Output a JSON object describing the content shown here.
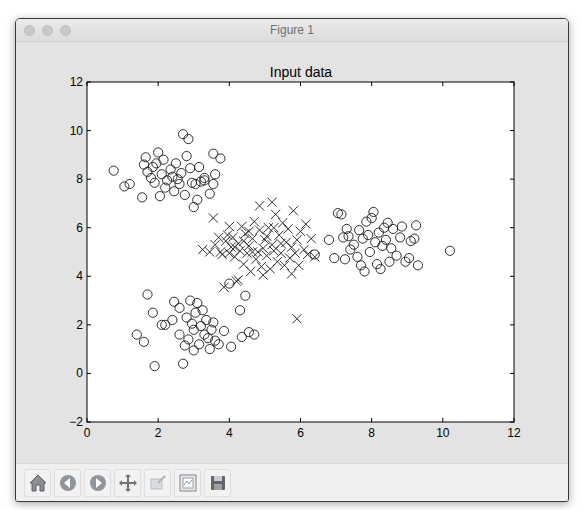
{
  "window": {
    "title": "Figure 1"
  },
  "toolbar": {
    "buttons": [
      {
        "name": "home",
        "icon": "home-icon",
        "tooltip": "Reset original view"
      },
      {
        "name": "back",
        "icon": "arrow-left-icon",
        "tooltip": "Back to previous view"
      },
      {
        "name": "forward",
        "icon": "arrow-right-icon",
        "tooltip": "Forward to next view"
      },
      {
        "name": "pan",
        "icon": "move-arrows-icon",
        "tooltip": "Pan axes"
      },
      {
        "name": "zoom",
        "icon": "zoom-rect-icon",
        "tooltip": "Zoom to rectangle"
      },
      {
        "name": "subplots",
        "icon": "subplots-config-icon",
        "tooltip": "Configure subplots"
      },
      {
        "name": "save",
        "icon": "floppy-disk-icon",
        "tooltip": "Save the figure"
      }
    ]
  },
  "colors": {
    "figure_bg": "#e3e3e3",
    "axes_bg": "#ffffff",
    "marker_edge": "#1a1a1a"
  },
  "chart_data": {
    "type": "scatter",
    "title": "Input data",
    "xlabel": "",
    "ylabel": "",
    "xlim": [
      0,
      12
    ],
    "ylim": [
      -2,
      12
    ],
    "xticks": [
      0,
      2,
      4,
      6,
      8,
      10,
      12
    ],
    "yticks": [
      -2,
      0,
      2,
      4,
      6,
      8,
      10,
      12
    ],
    "grid": false,
    "legend": null,
    "series": [
      {
        "name": "class-circle-upper-left",
        "marker": "o",
        "facecolor": "none",
        "points": [
          [
            0.75,
            8.35
          ],
          [
            1.05,
            7.7
          ],
          [
            1.2,
            7.8
          ],
          [
            1.55,
            7.25
          ],
          [
            1.6,
            8.6
          ],
          [
            1.65,
            8.9
          ],
          [
            1.7,
            8.3
          ],
          [
            1.8,
            8.05
          ],
          [
            1.85,
            8.5
          ],
          [
            1.9,
            7.85
          ],
          [
            1.95,
            8.65
          ],
          [
            2.0,
            9.1
          ],
          [
            2.05,
            7.3
          ],
          [
            2.1,
            8.2
          ],
          [
            2.15,
            8.8
          ],
          [
            2.2,
            7.65
          ],
          [
            2.25,
            7.95
          ],
          [
            2.35,
            8.4
          ],
          [
            2.4,
            8.1
          ],
          [
            2.45,
            7.5
          ],
          [
            2.5,
            8.65
          ],
          [
            2.55,
            8.0
          ],
          [
            2.6,
            7.8
          ],
          [
            2.65,
            8.25
          ],
          [
            2.7,
            9.85
          ],
          [
            2.75,
            7.35
          ],
          [
            2.8,
            8.95
          ],
          [
            2.85,
            9.65
          ],
          [
            2.9,
            8.45
          ],
          [
            2.95,
            7.85
          ],
          [
            3.0,
            6.85
          ],
          [
            3.05,
            7.8
          ],
          [
            3.1,
            7.15
          ],
          [
            3.15,
            8.5
          ],
          [
            3.2,
            7.9
          ],
          [
            3.3,
            7.95
          ],
          [
            3.45,
            7.4
          ],
          [
            3.55,
            7.8
          ],
          [
            3.6,
            8.2
          ],
          [
            3.55,
            9.05
          ],
          [
            3.75,
            8.85
          ],
          [
            3.3,
            8.05
          ]
        ]
      },
      {
        "name": "class-circle-lower-left",
        "marker": "o",
        "facecolor": "none",
        "points": [
          [
            1.4,
            1.6
          ],
          [
            1.6,
            1.3
          ],
          [
            1.7,
            3.25
          ],
          [
            1.9,
            0.3
          ],
          [
            1.85,
            2.5
          ],
          [
            2.1,
            2.0
          ],
          [
            2.2,
            2.0
          ],
          [
            2.4,
            2.2
          ],
          [
            2.45,
            2.95
          ],
          [
            2.6,
            2.7
          ],
          [
            2.6,
            1.6
          ],
          [
            2.7,
            0.4
          ],
          [
            2.75,
            1.15
          ],
          [
            2.8,
            2.3
          ],
          [
            2.85,
            1.4
          ],
          [
            2.9,
            3.0
          ],
          [
            2.95,
            2.05
          ],
          [
            3.0,
            0.95
          ],
          [
            3.0,
            1.8
          ],
          [
            3.05,
            2.5
          ],
          [
            3.1,
            2.9
          ],
          [
            3.15,
            1.2
          ],
          [
            3.2,
            1.95
          ],
          [
            3.25,
            2.6
          ],
          [
            3.3,
            1.6
          ],
          [
            3.35,
            2.2
          ],
          [
            3.4,
            1.45
          ],
          [
            3.45,
            1.0
          ],
          [
            3.5,
            1.8
          ],
          [
            3.55,
            2.1
          ],
          [
            3.6,
            1.35
          ],
          [
            3.7,
            1.2
          ],
          [
            3.85,
            1.75
          ],
          [
            4.05,
            1.1
          ],
          [
            4.3,
            2.6
          ],
          [
            4.35,
            1.5
          ],
          [
            4.45,
            3.2
          ],
          [
            4.55,
            1.7
          ],
          [
            4.7,
            1.6
          ],
          [
            4.0,
            3.7
          ]
        ]
      },
      {
        "name": "class-circle-right",
        "marker": "o",
        "facecolor": "none",
        "points": [
          [
            6.4,
            4.9
          ],
          [
            6.8,
            5.5
          ],
          [
            6.95,
            4.75
          ],
          [
            7.05,
            6.6
          ],
          [
            7.15,
            6.55
          ],
          [
            7.2,
            5.6
          ],
          [
            7.25,
            4.7
          ],
          [
            7.3,
            5.95
          ],
          [
            7.4,
            5.1
          ],
          [
            7.5,
            5.3
          ],
          [
            7.6,
            4.8
          ],
          [
            7.65,
            5.9
          ],
          [
            7.7,
            4.45
          ],
          [
            7.75,
            5.55
          ],
          [
            7.8,
            4.2
          ],
          [
            7.85,
            6.25
          ],
          [
            7.9,
            5.7
          ],
          [
            7.95,
            5.0
          ],
          [
            8.0,
            6.4
          ],
          [
            8.05,
            6.65
          ],
          [
            8.1,
            5.4
          ],
          [
            8.15,
            4.5
          ],
          [
            8.2,
            5.8
          ],
          [
            8.25,
            4.3
          ],
          [
            8.3,
            5.25
          ],
          [
            8.35,
            6.0
          ],
          [
            8.4,
            5.5
          ],
          [
            8.45,
            6.2
          ],
          [
            8.5,
            4.6
          ],
          [
            8.55,
            5.15
          ],
          [
            8.6,
            5.95
          ],
          [
            8.7,
            4.85
          ],
          [
            8.8,
            5.6
          ],
          [
            8.85,
            6.05
          ],
          [
            8.95,
            4.6
          ],
          [
            9.05,
            4.75
          ],
          [
            9.1,
            5.45
          ],
          [
            9.2,
            5.55
          ],
          [
            9.25,
            6.1
          ],
          [
            9.3,
            4.45
          ],
          [
            10.2,
            5.05
          ],
          [
            7.35,
            5.65
          ]
        ]
      },
      {
        "name": "class-cross-center",
        "marker": "x",
        "points": [
          [
            3.25,
            5.1
          ],
          [
            3.45,
            5.0
          ],
          [
            3.55,
            6.4
          ],
          [
            3.6,
            5.3
          ],
          [
            3.75,
            5.0
          ],
          [
            3.8,
            4.9
          ],
          [
            3.85,
            3.55
          ],
          [
            3.9,
            5.45
          ],
          [
            3.95,
            5.7
          ],
          [
            4.0,
            4.95
          ],
          [
            4.05,
            5.2
          ],
          [
            4.1,
            5.6
          ],
          [
            4.15,
            4.8
          ],
          [
            4.2,
            3.8
          ],
          [
            4.25,
            5.35
          ],
          [
            4.3,
            5.05
          ],
          [
            4.35,
            6.05
          ],
          [
            4.4,
            4.5
          ],
          [
            4.45,
            5.75
          ],
          [
            4.5,
            4.95
          ],
          [
            4.55,
            5.25
          ],
          [
            4.6,
            4.2
          ],
          [
            4.65,
            5.55
          ],
          [
            4.7,
            6.25
          ],
          [
            4.75,
            4.7
          ],
          [
            4.8,
            5.0
          ],
          [
            4.85,
            5.9
          ],
          [
            4.9,
            4.4
          ],
          [
            4.95,
            5.15
          ],
          [
            5.0,
            5.5
          ],
          [
            5.05,
            4.85
          ],
          [
            5.1,
            6.0
          ],
          [
            5.15,
            4.3
          ],
          [
            5.2,
            5.3
          ],
          [
            5.25,
            5.05
          ],
          [
            5.3,
            6.55
          ],
          [
            5.35,
            4.6
          ],
          [
            5.4,
            5.7
          ],
          [
            5.45,
            4.95
          ],
          [
            5.5,
            6.2
          ],
          [
            5.55,
            4.45
          ],
          [
            5.6,
            5.4
          ],
          [
            5.65,
            5.95
          ],
          [
            5.7,
            4.75
          ],
          [
            5.75,
            5.2
          ],
          [
            5.8,
            6.7
          ],
          [
            5.85,
            4.95
          ],
          [
            5.9,
            5.5
          ],
          [
            5.95,
            4.45
          ],
          [
            6.0,
            5.85
          ],
          [
            6.1,
            5.1
          ],
          [
            6.2,
            4.9
          ],
          [
            6.3,
            5.55
          ],
          [
            6.4,
            4.8
          ],
          [
            5.9,
            2.25
          ],
          [
            4.25,
            3.85
          ],
          [
            4.85,
            6.9
          ],
          [
            5.2,
            7.05
          ],
          [
            4.55,
            5.85
          ],
          [
            5.05,
            5.65
          ],
          [
            4.65,
            5.0
          ],
          [
            5.45,
            5.35
          ],
          [
            4.0,
            6.05
          ],
          [
            3.7,
            5.6
          ],
          [
            6.15,
            6.15
          ],
          [
            5.75,
            4.1
          ],
          [
            4.95,
            4.05
          ],
          [
            4.4,
            5.45
          ],
          [
            5.25,
            6.0
          ],
          [
            4.15,
            5.2
          ]
        ]
      }
    ]
  }
}
